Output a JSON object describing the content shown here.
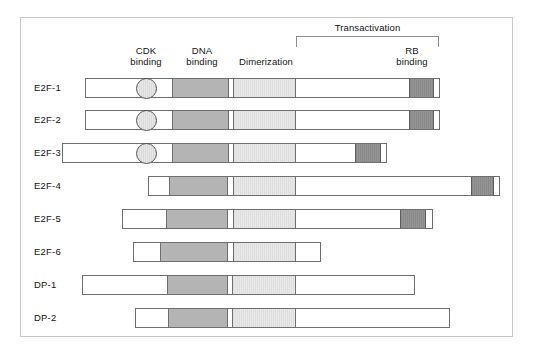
{
  "figure": {
    "title_labels": {
      "transactivation": "Transactivation",
      "cdk_binding": "CDK\nbinding",
      "dna_binding": "DNA\nbinding",
      "dimerization": "Dimerization",
      "rb_binding": "RB\nbinding"
    },
    "colors": {
      "dna_binding_fill": "#b4b4b4",
      "dimerization_fill": "#dedede",
      "rb_binding_fill": "#8a8a8a",
      "cdk_circle_fill": "#dcdcdc",
      "bar_outline": "#6f6f6f",
      "frame_border": "#c9c9c9",
      "background": "#ffffff"
    },
    "header_positions": {
      "cdk_center_x": 146,
      "dna_center_x": 202,
      "dimerization_center_x": 266,
      "rb_center_x": 412,
      "transactivation_left_x": 296,
      "transactivation_right_x": 439
    },
    "rows": [
      {
        "label": "E2F-1",
        "top": 78,
        "bar_left": 85,
        "bar_right": 440,
        "cdk_circle": {
          "center_x": 146
        },
        "segments": [
          {
            "name": "dna-binding",
            "left": 172,
            "right": 229
          },
          {
            "name": "dimerization",
            "left": 233,
            "right": 296
          },
          {
            "name": "rb-binding",
            "left": 409,
            "right": 434
          }
        ]
      },
      {
        "label": "E2F-2",
        "top": 110,
        "bar_left": 85,
        "bar_right": 440,
        "cdk_circle": {
          "center_x": 146
        },
        "segments": [
          {
            "name": "dna-binding",
            "left": 172,
            "right": 229
          },
          {
            "name": "dimerization",
            "left": 233,
            "right": 296
          },
          {
            "name": "rb-binding",
            "left": 409,
            "right": 434
          }
        ]
      },
      {
        "label": "E2F-3",
        "top": 143,
        "bar_left": 62,
        "bar_right": 387,
        "cdk_circle": {
          "center_x": 146
        },
        "segments": [
          {
            "name": "dna-binding",
            "left": 172,
            "right": 229
          },
          {
            "name": "dimerization",
            "left": 233,
            "right": 296
          },
          {
            "name": "rb-binding",
            "left": 355,
            "right": 381
          }
        ]
      },
      {
        "label": "E2F-4",
        "top": 176,
        "bar_left": 148,
        "bar_right": 500,
        "cdk_circle": null,
        "segments": [
          {
            "name": "dna-binding",
            "left": 169,
            "right": 228
          },
          {
            "name": "dimerization",
            "left": 233,
            "right": 296
          },
          {
            "name": "rb-binding",
            "left": 471,
            "right": 494
          }
        ]
      },
      {
        "label": "E2F-5",
        "top": 209,
        "bar_left": 122,
        "bar_right": 433,
        "cdk_circle": null,
        "segments": [
          {
            "name": "dna-binding",
            "left": 166,
            "right": 228
          },
          {
            "name": "dimerization",
            "left": 233,
            "right": 296
          },
          {
            "name": "rb-binding",
            "left": 400,
            "right": 426
          }
        ]
      },
      {
        "label": "E2F-6",
        "top": 242,
        "bar_left": 133,
        "bar_right": 321,
        "cdk_circle": null,
        "segments": [
          {
            "name": "dna-binding",
            "left": 160,
            "right": 228
          },
          {
            "name": "dimerization",
            "left": 233,
            "right": 296
          }
        ]
      },
      {
        "label": "DP-1",
        "top": 275,
        "bar_left": 82,
        "bar_right": 415,
        "cdk_circle": null,
        "segments": [
          {
            "name": "dna-binding",
            "left": 167,
            "right": 228
          },
          {
            "name": "dimerization",
            "left": 232,
            "right": 296
          }
        ]
      },
      {
        "label": "DP-2",
        "top": 308,
        "bar_left": 135,
        "bar_right": 450,
        "cdk_circle": null,
        "segments": [
          {
            "name": "dna-binding",
            "left": 168,
            "right": 228
          },
          {
            "name": "dimerization",
            "left": 232,
            "right": 296
          }
        ]
      }
    ]
  }
}
